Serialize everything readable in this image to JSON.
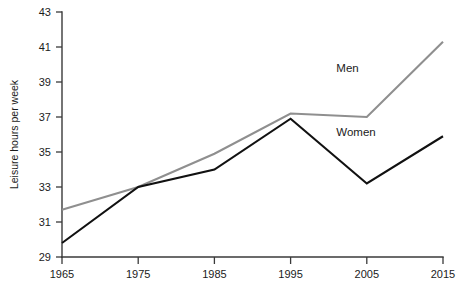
{
  "chart_data": {
    "type": "line",
    "title": "",
    "xlabel": "",
    "ylabel": "Leisure hours per week",
    "x": [
      1965,
      1975,
      1985,
      1995,
      2005,
      2015
    ],
    "xtick_labels": [
      "1965",
      "1975",
      "1985",
      "1995",
      "2005",
      "2015"
    ],
    "ytick_labels": [
      "29",
      "31",
      "33",
      "35",
      "37",
      "39",
      "41",
      "43"
    ],
    "yticks": [
      29,
      31,
      33,
      35,
      37,
      39,
      41,
      43
    ],
    "xlim": [
      1965,
      2015
    ],
    "ylim": [
      29,
      43
    ],
    "grid": false,
    "legend_position": "inline-right",
    "series": [
      {
        "name": "Men",
        "color": "#8f8f8f",
        "values": [
          31.7,
          33.0,
          34.9,
          37.2,
          37.0,
          41.3
        ],
        "label_x": 2001,
        "label_y": 39.6
      },
      {
        "name": "Women",
        "color": "#111111",
        "values": [
          29.8,
          33.0,
          34.0,
          36.9,
          33.2,
          35.9
        ],
        "label_x": 2001,
        "label_y": 35.9
      }
    ]
  },
  "axes": {
    "y_label": "Leisure hours per week"
  }
}
